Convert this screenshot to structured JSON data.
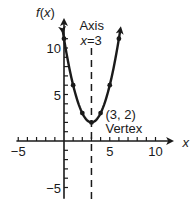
{
  "chart_data": {
    "type": "line",
    "title": "",
    "xlabel": "x",
    "ylabel": "f(x)",
    "xlim": [
      -5,
      10
    ],
    "ylim": [
      -5,
      10
    ],
    "x_tick_labels": [
      {
        "value": -5,
        "label": "−5"
      },
      {
        "value": 5,
        "label": "5"
      },
      {
        "value": 10,
        "label": "10"
      }
    ],
    "y_tick_labels": [
      {
        "value": 10,
        "label": "10"
      },
      {
        "value": 5,
        "label": "5"
      },
      {
        "value": -5,
        "label": "−5"
      }
    ],
    "series": [
      {
        "name": "f(x) = (x − 3)² + 2",
        "x": [
          0,
          1,
          2,
          3,
          4,
          5,
          6
        ],
        "y": [
          11,
          6,
          3,
          2,
          3,
          6,
          11
        ]
      }
    ],
    "axis_of_symmetry": {
      "x": 3,
      "label_line1": "Axis",
      "label_line2": "x = 3",
      "label_var": "x",
      "label_eq": "=",
      "label_val": "3"
    },
    "vertex": {
      "x": 3,
      "y": 2,
      "label_coords": "(3, 2)",
      "label_name": "Vertex"
    },
    "grid": false,
    "legend": "none"
  }
}
